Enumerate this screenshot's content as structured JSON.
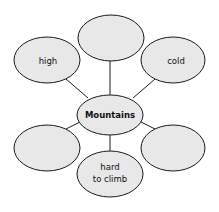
{
  "diagram": {
    "type": "web",
    "center": {
      "label": "Mountains"
    },
    "nodes": [
      {
        "id": "top",
        "label": ""
      },
      {
        "id": "top-left",
        "label": "high"
      },
      {
        "id": "top-right",
        "label": "cold"
      },
      {
        "id": "bottom-left",
        "label": ""
      },
      {
        "id": "bottom",
        "line1": "hard",
        "line2": "to climb"
      },
      {
        "id": "bottom-right",
        "label": ""
      }
    ],
    "colors": {
      "fill": "#e8e8e8",
      "stroke": "#1a1a1a"
    }
  }
}
